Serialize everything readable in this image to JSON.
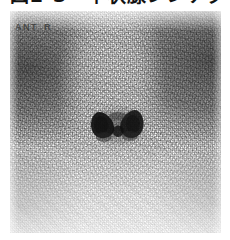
{
  "figure": {
    "caption_cropped": "図2-3　甲状腺シンチグラフィ像（正常）",
    "modality_label": "scintigram"
  },
  "image": {
    "orientation_marker": "ANT",
    "side_marker": "R",
    "features": {
      "central_uptake_shape": "butterfly-bilobed",
      "central_uptake_label": "thyroid-uptake",
      "background": "grainy-film-noise"
    },
    "colors": {
      "paper": "#ffffff",
      "film_light": "#fdfdfd",
      "film_mid": "#8f8f8f",
      "uptake_dark": "#141414",
      "caption_text": "#121212",
      "marker_text": "#373737"
    }
  }
}
